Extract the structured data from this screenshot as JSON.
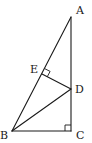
{
  "figure": {
    "type": "geometry",
    "points": [
      {
        "name": "A",
        "x": 71,
        "y": 17,
        "label_x": 76,
        "label_y": 14
      },
      {
        "name": "B",
        "x": 12,
        "y": 131,
        "label_x": 0,
        "label_y": 139
      },
      {
        "name": "C",
        "x": 71,
        "y": 131,
        "label_x": 76,
        "label_y": 139
      },
      {
        "name": "D",
        "x": 71,
        "y": 89,
        "label_x": 75,
        "label_y": 93
      },
      {
        "name": "E",
        "x": 42,
        "y": 74,
        "label_x": 30,
        "label_y": 73
      }
    ],
    "segments": [
      [
        "A",
        "B"
      ],
      [
        "A",
        "C"
      ],
      [
        "B",
        "C"
      ],
      [
        "B",
        "D"
      ],
      [
        "D",
        "E"
      ]
    ],
    "right_angles": [
      "C",
      "E"
    ],
    "labels": {
      "A": "A",
      "B": "B",
      "C": "C",
      "D": "D",
      "E": "E"
    },
    "stroke_color": "#1a1a1a"
  }
}
